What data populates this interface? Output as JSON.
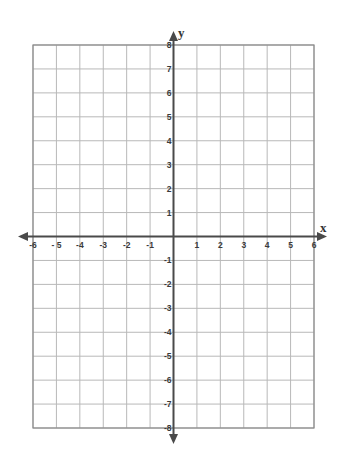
{
  "chart_data": {
    "type": "coordinate-grid",
    "title": "",
    "xlabel": "x",
    "ylabel": "y",
    "xlim": [
      -6,
      6
    ],
    "ylim": [
      -8,
      8
    ],
    "grid": true,
    "x_ticks": [
      -6,
      -5,
      -4,
      -3,
      -2,
      -1,
      1,
      2,
      3,
      4,
      5,
      6
    ],
    "y_ticks": [
      8,
      7,
      6,
      5,
      4,
      3,
      2,
      1,
      -1,
      -2,
      -3,
      -4,
      -5,
      -6,
      -7,
      -8
    ],
    "x_tick_labels": [
      "-6",
      "- 5",
      "-4",
      "-3",
      "-2",
      "-1",
      "1",
      "2",
      "3",
      "4",
      "5",
      "6"
    ],
    "y_tick_labels": [
      "8",
      "7",
      "6",
      "5",
      "4",
      "3",
      "2",
      "1",
      "-1",
      "-2",
      "-3",
      "-4",
      "-5",
      "-6",
      "-7",
      "-8"
    ],
    "series": []
  },
  "axes": {
    "x_name": "x",
    "y_name": "y"
  },
  "colors": {
    "grid_line": "#b8b8b8",
    "border": "#8a8a8a",
    "axis": "#4a4a4a",
    "label": "#3a3a3a",
    "background": "#ffffff"
  }
}
